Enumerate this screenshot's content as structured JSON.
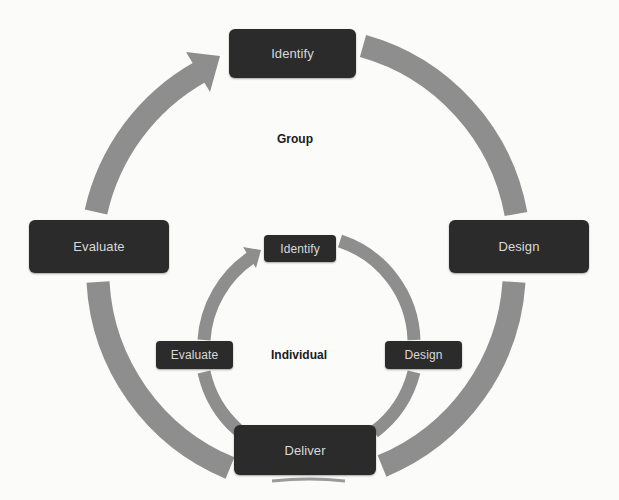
{
  "diagram": {
    "type": "nested-cycle",
    "colors": {
      "box_fill": "#2b2b2b",
      "box_text": "#d9d9d9",
      "arrow_fill": "#8e8e8e",
      "label_text": "#1a1a1a",
      "background": "#fbfbfa"
    },
    "outer_cycle": {
      "label": "Group",
      "steps": [
        {
          "id": "outer-identify",
          "label": "Identify"
        },
        {
          "id": "outer-design",
          "label": "Design"
        },
        {
          "id": "deliver",
          "label": "Deliver"
        },
        {
          "id": "outer-evaluate",
          "label": "Evaluate"
        }
      ]
    },
    "inner_cycle": {
      "label": "Individual",
      "steps": [
        {
          "id": "inner-identify",
          "label": "Identify"
        },
        {
          "id": "inner-design",
          "label": "Design"
        },
        {
          "id": "deliver",
          "label": "Deliver"
        },
        {
          "id": "inner-evaluate",
          "label": "Evaluate"
        }
      ]
    },
    "edges": [
      {
        "from": "outer-identify",
        "to": "outer-design",
        "cycle": "outer"
      },
      {
        "from": "outer-design",
        "to": "deliver",
        "cycle": "outer"
      },
      {
        "from": "deliver",
        "to": "outer-evaluate",
        "cycle": "outer"
      },
      {
        "from": "outer-evaluate",
        "to": "outer-identify",
        "cycle": "outer",
        "arrowhead": true
      },
      {
        "from": "inner-identify",
        "to": "inner-design",
        "cycle": "inner"
      },
      {
        "from": "inner-design",
        "to": "deliver",
        "cycle": "inner"
      },
      {
        "from": "deliver",
        "to": "inner-evaluate",
        "cycle": "inner"
      },
      {
        "from": "inner-evaluate",
        "to": "inner-identify",
        "cycle": "inner",
        "arrowhead": true
      }
    ]
  }
}
